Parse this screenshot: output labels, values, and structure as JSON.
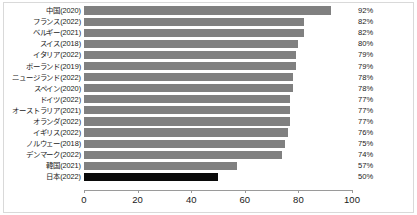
{
  "chart_data": {
    "type": "bar",
    "orientation": "horizontal",
    "title": "",
    "subtitle": "",
    "xlabel": "",
    "ylabel": "",
    "xlim": [
      0,
      100
    ],
    "grid": false,
    "legend": null,
    "xticks": [
      0,
      20,
      40,
      60,
      80,
      100
    ],
    "xtick_labels": [
      "0",
      "20",
      "40",
      "60",
      "80",
      "100"
    ],
    "categories": [
      "中国(2020)",
      "フランス(2022)",
      "ベルギー(2021)",
      "スイス(2018)",
      "イタリア(2022)",
      "ポーランド(2019)",
      "ニュージランド(2022)",
      "スペイン(2020)",
      "ドイツ(2022)",
      "オーストラリア(2021)",
      "オランダ(2022)",
      "イギリス(2022)",
      "ノルウェー(2018)",
      "デンマーク(2022)",
      "韓国(2021)",
      "日本(2022)"
    ],
    "values": [
      92,
      82,
      82,
      80,
      79,
      79,
      78,
      78,
      77,
      77,
      77,
      76,
      75,
      74,
      57,
      50
    ],
    "value_labels": [
      "92%",
      "82%",
      "82%",
      "80%",
      "79%",
      "79%",
      "78%",
      "78%",
      "77%",
      "77%",
      "77%",
      "76%",
      "75%",
      "74%",
      "57%",
      "50%"
    ],
    "bar_color": "#808080",
    "highlight_color": "#0a0a0a",
    "highlight_index": 15
  }
}
